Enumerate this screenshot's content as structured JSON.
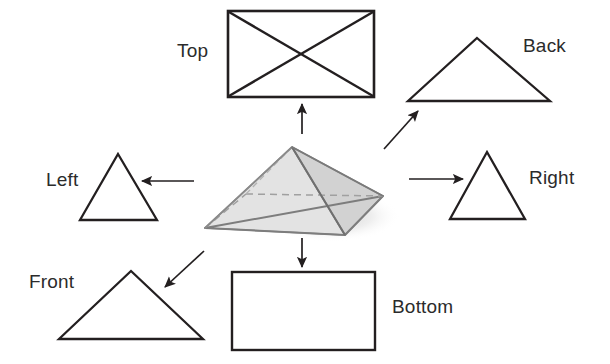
{
  "figure": {
    "type": "orthographic-projection-diagram",
    "background_color": "#ffffff",
    "line_color": "#231f20",
    "text_color": "#2b2b2b"
  },
  "labels": {
    "top": "Top",
    "back": "Back",
    "left": "Left",
    "right": "Right",
    "front": "Front",
    "bottom": "Bottom"
  },
  "views": [
    {
      "name": "top",
      "label": "Top",
      "shape": "rectangle-with-both-diagonals",
      "points": "228,11 374,11 374,97 228,97"
    },
    {
      "name": "back",
      "label": "Back",
      "shape": "triangle",
      "points": "477,38 550,101 408,101"
    },
    {
      "name": "left",
      "label": "Left",
      "shape": "triangle",
      "points": "118,154 157,220 80,220"
    },
    {
      "name": "right",
      "label": "Right",
      "shape": "triangle",
      "points": "487,152 525,219 450,219"
    },
    {
      "name": "front",
      "label": "Front",
      "shape": "triangle",
      "points": "131,271 203,339 59,339"
    },
    {
      "name": "bottom",
      "label": "Bottom",
      "shape": "rectangle",
      "points": "232,272 375,272 375,350 232,350"
    }
  ],
  "object": {
    "name": "pyramid",
    "apex": "292,147",
    "base_front_left": "205,228",
    "base_front_right": "345,235",
    "base_right": "383,196",
    "base_hidden_back": "246,194",
    "face_left_fill": "#e8e8e8",
    "face_right_fill": "#d6d6d6",
    "face_front_fill": "#dedede",
    "hidden_edge_style": "dashed"
  },
  "arrows": [
    {
      "name": "arrow-to-top",
      "from": "302,134",
      "to": "302,103",
      "direction": "up"
    },
    {
      "name": "arrow-to-back",
      "from": "384,149",
      "to": "419,110",
      "direction": "up-right"
    },
    {
      "name": "arrow-to-left",
      "from": "194,181",
      "to": "141,181",
      "direction": "left"
    },
    {
      "name": "arrow-to-right",
      "from": "409,179",
      "to": "464,179",
      "direction": "right"
    },
    {
      "name": "arrow-to-front",
      "from": "204,251",
      "to": "164,288",
      "direction": "down-left"
    },
    {
      "name": "arrow-to-bottom",
      "from": "302,238",
      "to": "302,268",
      "direction": "down"
    }
  ]
}
